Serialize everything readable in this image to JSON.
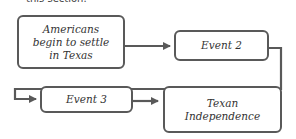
{
  "caption": "this section.",
  "diagram": {
    "type": "flowchart",
    "nodes": [
      {
        "id": "n1",
        "label": "Americans begin to settle in Texas",
        "lines": [
          "Americans",
          "begin to settle",
          "in Texas"
        ]
      },
      {
        "id": "n2",
        "label": "Event 2"
      },
      {
        "id": "n3",
        "label": "Event 3"
      },
      {
        "id": "n4",
        "label": "Texan Independence",
        "lines": [
          "Texan",
          "Independence"
        ]
      }
    ],
    "edges": [
      {
        "from": "n1",
        "to": "n2"
      },
      {
        "from": "n2",
        "to": "n3"
      },
      {
        "from": "n3",
        "to": "n4"
      }
    ],
    "colors": {
      "stroke": "#595959",
      "text": "#333333",
      "background": "#ffffff"
    }
  }
}
